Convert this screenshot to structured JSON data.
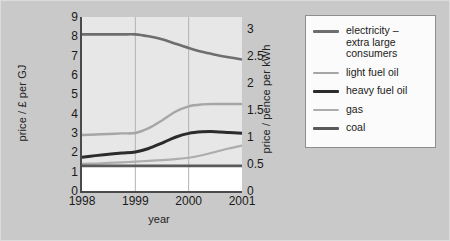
{
  "figure": {
    "background_color": "#c9c9c9",
    "plot_background_color": "#e7e7e7",
    "below_coal_band_color": "#ffffff"
  },
  "chart_data": {
    "type": "line",
    "title": "",
    "xlabel": "year",
    "ylabel": "price / £ per GJ",
    "ylabel_secondary": "price / pence per kWh",
    "xlim": [
      1998,
      2001
    ],
    "ylim": [
      0,
      9
    ],
    "ylim_secondary": [
      0,
      3.214
    ],
    "grid": true,
    "grid_orientation": "vertical",
    "legend_position": "right-outside",
    "xticks": [
      "1998",
      "1999",
      "2000",
      "2001"
    ],
    "xtick_values": [
      1998,
      1999,
      2000,
      2001
    ],
    "yticks_left": [
      "0",
      "1",
      "2",
      "3",
      "4",
      "5",
      "6",
      "7",
      "8",
      "9"
    ],
    "ytick_values_left": [
      0,
      1,
      2,
      3,
      4,
      5,
      6,
      7,
      8,
      9
    ],
    "yticks_right": [
      "0",
      "0.5",
      "1",
      "1.5",
      "2",
      "2.5",
      "3"
    ],
    "ytick_values_right": [
      0,
      0.5,
      1,
      1.5,
      2,
      2.5,
      3
    ],
    "x": [
      1998,
      1998.25,
      1998.5,
      1998.75,
      1999,
      1999.25,
      1999.5,
      1999.75,
      2000,
      2000.25,
      2000.5,
      2000.75,
      2001
    ],
    "series": [
      {
        "name": "electricity – extra large consumers",
        "legend_label": "electricity –\nextra large\nconsumers",
        "color": "#6e6e6e",
        "width": 2.6,
        "values": [
          8.1,
          8.1,
          8.1,
          8.1,
          8.1,
          8.0,
          7.85,
          7.62,
          7.4,
          7.2,
          7.05,
          6.92,
          6.8
        ]
      },
      {
        "name": "light fuel oil",
        "legend_label": "light fuel oil",
        "color": "#a6a6a6",
        "width": 2.4,
        "values": [
          2.9,
          2.92,
          2.95,
          2.98,
          3.0,
          3.25,
          3.65,
          4.1,
          4.38,
          4.48,
          4.5,
          4.5,
          4.5
        ]
      },
      {
        "name": "heavy fuel oil",
        "legend_label": "heavy fuel oil",
        "color": "#2b2b2b",
        "width": 3.0,
        "values": [
          1.75,
          1.83,
          1.9,
          1.96,
          2.02,
          2.2,
          2.48,
          2.78,
          2.98,
          3.06,
          3.07,
          3.03,
          2.99
        ]
      },
      {
        "name": "gas",
        "legend_label": "gas",
        "color": "#adadad",
        "width": 2.2,
        "values": [
          1.4,
          1.42,
          1.45,
          1.48,
          1.52,
          1.56,
          1.6,
          1.65,
          1.72,
          1.85,
          2.02,
          2.2,
          2.35
        ]
      },
      {
        "name": "coal",
        "legend_label": "coal",
        "color": "#5a5a5a",
        "width": 2.6,
        "values": [
          1.3,
          1.3,
          1.3,
          1.3,
          1.3,
          1.3,
          1.3,
          1.3,
          1.3,
          1.3,
          1.3,
          1.3,
          1.3
        ]
      }
    ]
  }
}
